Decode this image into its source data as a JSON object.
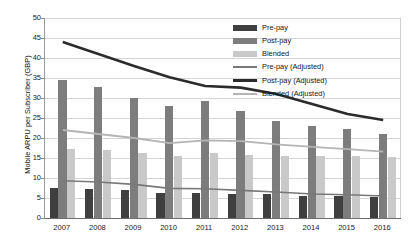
{
  "chart_data": {
    "type": "bar",
    "title": "",
    "xlabel": "",
    "ylabel": "Mobile ARPU per Subscriber (GBP)",
    "categories": [
      "2007",
      "2008",
      "2009",
      "2010",
      "2011",
      "2012",
      "2013",
      "2014",
      "2015",
      "2016"
    ],
    "ylim": [
      0,
      50
    ],
    "yticks": [
      0,
      5,
      10,
      15,
      20,
      25,
      30,
      35,
      40,
      45,
      50
    ],
    "ytick_labels": [
      "0",
      "5",
      "10",
      "15",
      "20",
      "25",
      "30",
      "35",
      "40",
      "45",
      "50"
    ],
    "grid": true,
    "legend_position": "top-right",
    "bar_series": [
      {
        "name": "Pre-pay",
        "color": "#3f3f3f",
        "values": [
          7.5,
          7.2,
          7.0,
          6.2,
          6.3,
          6.1,
          5.9,
          5.5,
          5.4,
          5.2
        ]
      },
      {
        "name": "Post-pay",
        "color": "#7d7d7d",
        "values": [
          34.5,
          32.8,
          30.0,
          28.0,
          29.2,
          26.8,
          24.3,
          23.0,
          22.3,
          21.0
        ]
      },
      {
        "name": "Blended",
        "color": "#c9c9c9",
        "values": [
          17.3,
          17.0,
          16.2,
          15.4,
          16.2,
          15.8,
          15.6,
          15.5,
          15.4,
          15.2
        ]
      }
    ],
    "line_series": [
      {
        "name": "Pre-pay (Adjusted)",
        "color": "#787878",
        "width": 1.6,
        "values": [
          9.3,
          9.0,
          8.4,
          7.4,
          7.3,
          6.9,
          6.5,
          6.0,
          5.8,
          5.5
        ]
      },
      {
        "name": "Post-pay (Adjusted)",
        "color": "#2b2b2b",
        "width": 2.6,
        "values": [
          44.0,
          41.0,
          38.0,
          35.2,
          33.0,
          32.6,
          31.0,
          28.5,
          26.0,
          24.5
        ]
      },
      {
        "name": "Blended (Adjusted)",
        "color": "#b4b4b4",
        "width": 1.8,
        "values": [
          22.0,
          21.0,
          20.0,
          18.7,
          19.4,
          19.2,
          18.4,
          17.8,
          17.2,
          16.6
        ]
      }
    ],
    "legend_entries": [
      {
        "label": "Pre-pay",
        "kind": "bar",
        "color": "#3f3f3f"
      },
      {
        "label": "Post-pay",
        "kind": "bar",
        "color": "#7d7d7d"
      },
      {
        "label": "Blended",
        "kind": "bar",
        "color": "#c9c9c9"
      },
      {
        "label": "Pre-pay (Adjusted)",
        "kind": "line",
        "color": "#787878"
      },
      {
        "label": "Post-pay (Adjusted)",
        "kind": "line",
        "color": "#2b2b2b"
      },
      {
        "label": "Blended (Adjusted)",
        "kind": "line",
        "color": "#b4b4b4"
      }
    ]
  }
}
